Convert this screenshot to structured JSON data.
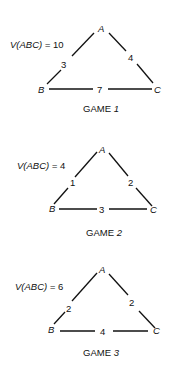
{
  "games": [
    {
      "title": "GAME",
      "number": "1",
      "value_label": "V(ABC) = 10",
      "value_prefix": "V(ABC) = ",
      "value": "10",
      "vertices": {
        "A": "A",
        "B": "B",
        "C": "C"
      },
      "edges": {
        "AB": "3",
        "AC": "4",
        "BC": "7"
      }
    },
    {
      "title": "GAME",
      "number": "2",
      "value_label": "V(ABC) = 4",
      "value_prefix": "V(ABC) = ",
      "value": "4",
      "vertices": {
        "A": "A",
        "B": "B",
        "C": "C"
      },
      "edges": {
        "AB": "1",
        "AC": "2",
        "BC": "3"
      }
    },
    {
      "title": "GAME",
      "number": "3",
      "value_label": "V(ABC) = 6",
      "value_prefix": "V(ABC) = ",
      "value": "6",
      "vertices": {
        "A": "A",
        "B": "B",
        "C": "C"
      },
      "edges": {
        "AB": "2",
        "AC": "2",
        "BC": "4"
      }
    }
  ]
}
